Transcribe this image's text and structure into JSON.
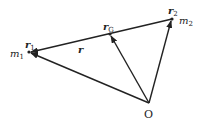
{
  "diagram": {
    "type": "vector-diagram",
    "points": {
      "O": {
        "x": 149,
        "y": 103,
        "label": "O"
      },
      "m1": {
        "x": 29,
        "y": 52,
        "mass_label": "m",
        "mass_sub": "1",
        "vec_label": "r",
        "vec_sub": "1"
      },
      "m2": {
        "x": 172,
        "y": 19,
        "mass_label": "m",
        "mass_sub": "2",
        "vec_label": "r",
        "vec_sub": "2"
      },
      "G": {
        "x": 110,
        "y": 34,
        "vec_label": "r",
        "vec_sub": "G"
      }
    },
    "relative_vector": {
      "label": "r",
      "from": "m2",
      "to": "m1"
    },
    "arrows": [
      {
        "from": "O",
        "to": "m1",
        "label": "r1"
      },
      {
        "from": "O",
        "to": "G",
        "label": "rG"
      },
      {
        "from": "O",
        "to": "m2",
        "label": "r2"
      },
      {
        "from": "m2",
        "to": "m1",
        "label": "r"
      }
    ],
    "colors": {
      "stroke": "#222222",
      "background": "#ffffff"
    }
  }
}
